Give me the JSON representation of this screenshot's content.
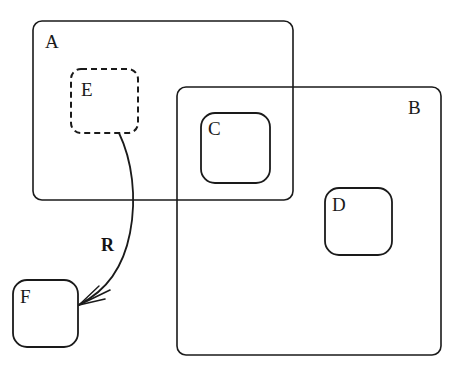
{
  "diagram": {
    "background_color": "#ffffff",
    "stroke_color": "#1a1a1a",
    "nodes": [
      {
        "id": "A",
        "label": "A",
        "shape": "rounded-rectangle",
        "style": "solid",
        "x": 33,
        "y": 21,
        "width": 260,
        "height": 179,
        "corner_radius": 9,
        "stroke_width": 1.6,
        "label_x": 45,
        "label_y": 32
      },
      {
        "id": "B",
        "label": "B",
        "shape": "rounded-rectangle",
        "style": "solid",
        "x": 177,
        "y": 87,
        "width": 264,
        "height": 268,
        "corner_radius": 9,
        "stroke_width": 1.6,
        "label_x": 408,
        "label_y": 98
      },
      {
        "id": "E",
        "label": "E",
        "shape": "rounded-rectangle",
        "style": "dashed",
        "x": 71,
        "y": 69,
        "width": 67,
        "height": 64,
        "corner_radius": 10,
        "stroke_width": 2.0,
        "dash_pattern": "6 4",
        "label_x": 81,
        "label_y": 80
      },
      {
        "id": "C",
        "label": "C",
        "shape": "rounded-rectangle",
        "style": "solid",
        "x": 201,
        "y": 113,
        "width": 69,
        "height": 70,
        "corner_radius": 14,
        "stroke_width": 1.8,
        "label_x": 208,
        "label_y": 119
      },
      {
        "id": "D",
        "label": "D",
        "shape": "rounded-rectangle",
        "style": "solid",
        "x": 325,
        "y": 188,
        "width": 67,
        "height": 67,
        "corner_radius": 14,
        "stroke_width": 1.8,
        "label_x": 332,
        "label_y": 195
      },
      {
        "id": "F",
        "label": "F",
        "shape": "rounded-rectangle",
        "style": "solid",
        "x": 13,
        "y": 280,
        "width": 65,
        "height": 67,
        "corner_radius": 14,
        "stroke_width": 1.8,
        "label_x": 20,
        "label_y": 287
      }
    ],
    "edges": [
      {
        "id": "R",
        "label": "R",
        "from": "E",
        "to": "F",
        "style": "solid-curved",
        "arrowhead": "open-v",
        "path": "M 119,133 C 132,160 137,197 130,233 C 123,269 106,291 80,304",
        "stroke_width": 1.8,
        "label_x": 101,
        "label_y": 236
      }
    ]
  }
}
